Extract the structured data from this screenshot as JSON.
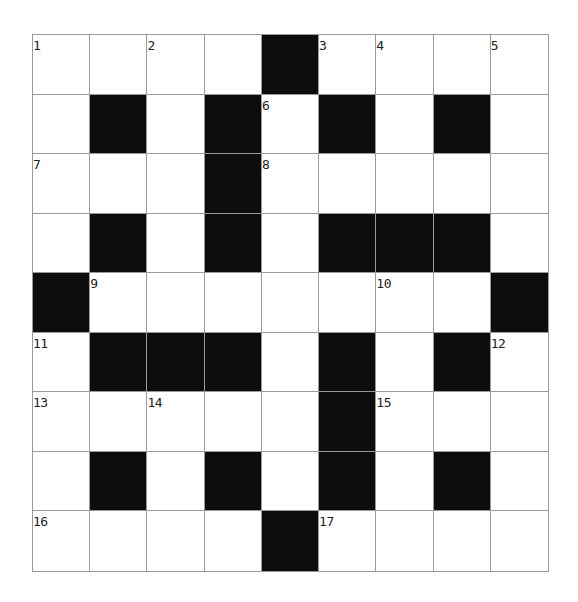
{
  "puzzle": {
    "title": "",
    "rows": 9,
    "cols": 9,
    "colors": {
      "block": "#0d0d0d",
      "cell": "#ffffff",
      "gridline": "#9a9a9a",
      "number": "#222222"
    },
    "layout": [
      "....#....",
      ".#.#.#.#.",
      "...#.....",
      ".#.#.###.",
      "#.......#",
      ".###.#.#.",
      ".....#...",
      ".#.#.#.#.",
      "....#...."
    ],
    "numbers": [
      {
        "row": 0,
        "col": 0,
        "n": "1"
      },
      {
        "row": 0,
        "col": 2,
        "n": "2"
      },
      {
        "row": 0,
        "col": 5,
        "n": "3"
      },
      {
        "row": 0,
        "col": 6,
        "n": "4"
      },
      {
        "row": 0,
        "col": 8,
        "n": "5"
      },
      {
        "row": 1,
        "col": 4,
        "n": "6"
      },
      {
        "row": 2,
        "col": 0,
        "n": "7"
      },
      {
        "row": 2,
        "col": 4,
        "n": "8"
      },
      {
        "row": 4,
        "col": 1,
        "n": "9"
      },
      {
        "row": 4,
        "col": 6,
        "n": "10"
      },
      {
        "row": 5,
        "col": 0,
        "n": "11"
      },
      {
        "row": 5,
        "col": 8,
        "n": "12"
      },
      {
        "row": 6,
        "col": 0,
        "n": "13"
      },
      {
        "row": 6,
        "col": 2,
        "n": "14"
      },
      {
        "row": 6,
        "col": 6,
        "n": "15"
      },
      {
        "row": 8,
        "col": 0,
        "n": "16"
      },
      {
        "row": 8,
        "col": 5,
        "n": "17"
      }
    ]
  }
}
